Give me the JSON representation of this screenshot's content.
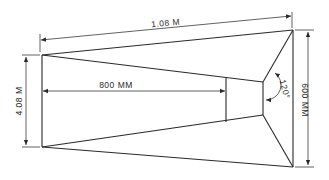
{
  "diagram": {
    "type": "technical-drawing",
    "labels": {
      "top_length": "1.08 M",
      "left_height": "4.08 M",
      "inner_length": "800 MM",
      "right_height": "600 MM",
      "angle": "120°"
    },
    "colors": {
      "line": "#2a2a2a",
      "background": "#ffffff"
    }
  }
}
